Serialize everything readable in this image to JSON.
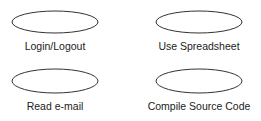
{
  "diagram": {
    "type": "use-case",
    "stroke_color": "#333333",
    "use_cases": [
      {
        "label": "Login/Logout"
      },
      {
        "label": "Use Spreadsheet"
      },
      {
        "label": "Read e-mail"
      },
      {
        "label": "Compile Source Code"
      }
    ]
  }
}
